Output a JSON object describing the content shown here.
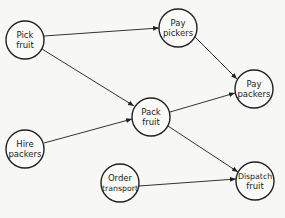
{
  "diagram": {
    "type": "activity-network",
    "nodes": [
      {
        "id": "pick_fruit",
        "line1": "Pick",
        "line2": "fruit",
        "cx": 25,
        "cy": 40
      },
      {
        "id": "pay_pickers",
        "line1": "Pay",
        "line2": "pickers",
        "cx": 178,
        "cy": 28
      },
      {
        "id": "pay_packers",
        "line1": "Pay",
        "line2": "packers",
        "cx": 254,
        "cy": 89
      },
      {
        "id": "pack_fruit",
        "line1": "Pack",
        "line2": "fruit",
        "cx": 151,
        "cy": 117
      },
      {
        "id": "hire_packers",
        "line1": "Hire",
        "line2": "packers",
        "cx": 25,
        "cy": 149
      },
      {
        "id": "order_transport",
        "line1": "Order",
        "line2": "transport",
        "cx": 120,
        "cy": 183
      },
      {
        "id": "dispatch_fruit",
        "line1": "Dispatch",
        "line2": "fruit",
        "cx": 255,
        "cy": 181
      }
    ],
    "edges": [
      {
        "from": "pick_fruit",
        "to": "pay_pickers"
      },
      {
        "from": "pick_fruit",
        "to": "pack_fruit"
      },
      {
        "from": "pay_pickers",
        "to": "pay_packers"
      },
      {
        "from": "pack_fruit",
        "to": "pay_packers"
      },
      {
        "from": "hire_packers",
        "to": "pack_fruit"
      },
      {
        "from": "pack_fruit",
        "to": "dispatch_fruit"
      },
      {
        "from": "order_transport",
        "to": "dispatch_fruit"
      }
    ]
  }
}
